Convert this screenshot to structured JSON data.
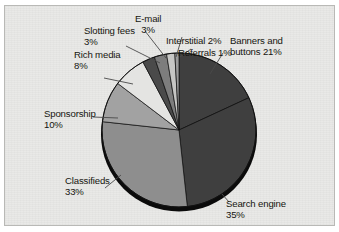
{
  "chart_data": {
    "type": "pie",
    "title": "",
    "subtitle": "",
    "xlabel": "",
    "ylabel": "",
    "legend_position": "none",
    "grid": false,
    "units": "percent",
    "total": 116,
    "note": "Labels are placed around the pie with leader lines; values shown as percentages on each label.",
    "categories": [
      "Search engine",
      "Classifieds",
      "Banners and buttons",
      "Sponsorship",
      "Rich media",
      "E-mail",
      "Slotting fees",
      "Interstitial",
      "Referrals"
    ],
    "values": [
      35,
      33,
      21,
      10,
      8,
      3,
      3,
      2,
      1
    ],
    "slices": [
      {
        "label": "Banners and buttons",
        "value": 21,
        "value_text": "21%",
        "color": "#3f3f3f"
      },
      {
        "label": "Search engine",
        "value": 35,
        "value_text": "35%",
        "color": "#3f3f3f"
      },
      {
        "label": "Classifieds",
        "value": 33,
        "value_text": "33%",
        "color": "#8e8e8e"
      },
      {
        "label": "Sponsorship",
        "value": 10,
        "value_text": "10%",
        "color": "#a2a2a2"
      },
      {
        "label": "Rich media",
        "value": 8,
        "value_text": "8%",
        "color": "#e4e4e2"
      },
      {
        "label": "Slotting fees",
        "value": 3,
        "value_text": "3%",
        "color": "#4a4a4a"
      },
      {
        "label": "E-mail",
        "value": 3,
        "value_text": "3%",
        "color": "#7d7d7d"
      },
      {
        "label": "Interstitial",
        "value": 2,
        "value_text": "2%",
        "color": "#c6c6c4"
      },
      {
        "label": "Referrals",
        "value": 1,
        "value_text": "1%",
        "color": "#9b9b9b"
      }
    ]
  },
  "labels": {
    "email": {
      "name": "E-mail",
      "value": "3%"
    },
    "interstitial": {
      "name": "Interstitial",
      "value": "2%"
    },
    "referrals": {
      "name": "Referrals",
      "value": "1%"
    },
    "banners": {
      "line1": "Banners and",
      "line2": "buttons 21%"
    },
    "slotting": {
      "name": "Slotting fees",
      "value": "3%"
    },
    "richmedia": {
      "name": "Rich media",
      "value": "8%"
    },
    "sponsorship": {
      "name": "Sponsorship",
      "value": "10%"
    },
    "classifieds": {
      "name": "Classifieds",
      "value": "33%"
    },
    "search": {
      "name": "Search engine",
      "value": "35%"
    }
  },
  "colors": {
    "page_background": "#ffffff",
    "panel_background": "#e9e9e7",
    "panel_border": "#b9b9b6",
    "text": "#15150f",
    "leader_line": "#4a4a4a",
    "pie_edge": "#111111",
    "pie_shadow": "#0b0b0b"
  }
}
